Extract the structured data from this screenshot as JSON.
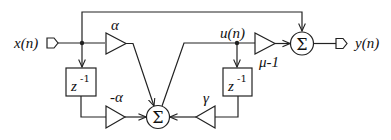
{
  "diagram": {
    "type": "signal-flow block diagram",
    "input_label": "x(n)",
    "output_label": "y(n)",
    "internal_node_label": "u(n)",
    "gains": {
      "alpha": "α",
      "neg_alpha": "-α",
      "gamma": "γ",
      "mu_minus_one": "μ-1"
    },
    "delays": {
      "left": {
        "base": "z",
        "exp": "-1"
      },
      "right": {
        "base": "z",
        "exp": "-1"
      }
    },
    "summers": {
      "middle": "Σ",
      "output": "Σ"
    },
    "colors": {
      "stroke": "#222222",
      "background": "#ffffff"
    }
  }
}
